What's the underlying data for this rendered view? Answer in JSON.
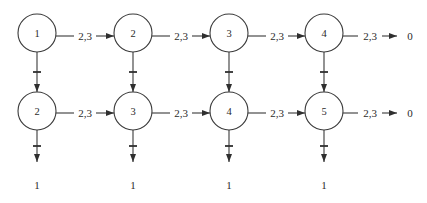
{
  "figure": {
    "type": "state-transition-diagram",
    "colors": {
      "ink": "#3a3a3a",
      "background": "#ffffff"
    },
    "top_row": {
      "nodes": [
        {
          "label": "1"
        },
        {
          "label": "2"
        },
        {
          "label": "3"
        },
        {
          "label": "4"
        }
      ],
      "edge_labels": [
        "2,3",
        "2,3",
        "2,3",
        "2,3"
      ],
      "terminal_label": "0"
    },
    "bottom_row": {
      "nodes": [
        {
          "label": "2"
        },
        {
          "label": "3"
        },
        {
          "label": "4"
        },
        {
          "label": "5"
        }
      ],
      "edge_labels": [
        "2,3",
        "2,3",
        "2,3",
        "2,3"
      ],
      "terminal_label": "0"
    },
    "sink_labels": [
      "1",
      "1",
      "1",
      "1"
    ]
  }
}
